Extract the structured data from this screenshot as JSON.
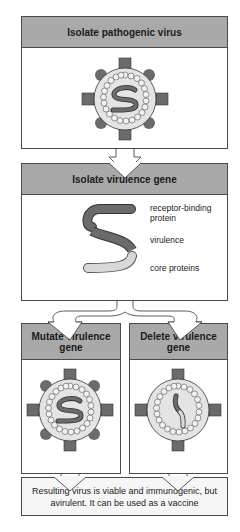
{
  "steps": {
    "isolate_virus": {
      "title": "Isolate pathogenic virus"
    },
    "isolate_gene": {
      "title": "Isolate virulence gene",
      "segments": [
        {
          "label": "receptor-binding protein",
          "color": "#6b6b6b"
        },
        {
          "label": "virulence",
          "color": "#6b6b6b"
        },
        {
          "label": "core proteins",
          "color": "#d8d8d8"
        }
      ]
    },
    "mutate": {
      "title": "Mutate virulence gene"
    },
    "delete": {
      "title": "Delete virulence gene"
    },
    "result": {
      "text": "Resulting virus is viable and immunogenic, but avirulent. It can be used as a vaccine"
    }
  },
  "labels": {
    "seg1_line1": "receptor-binding",
    "seg1_line2": "protein",
    "seg2": "virulence",
    "seg3": "core proteins"
  },
  "colors": {
    "header_fill": "#a9a9a9",
    "outline": "#4a4a4a",
    "spike_fill": "#6b6b6b",
    "capsid_fill": "#e4e4e4"
  }
}
